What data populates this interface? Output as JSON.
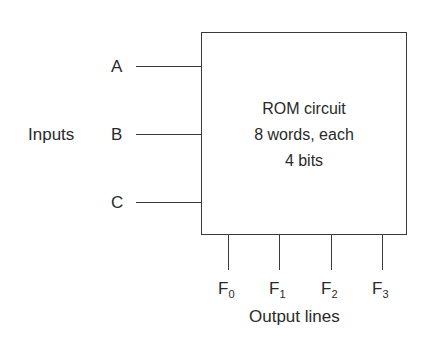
{
  "diagram": {
    "type": "block-diagram",
    "block": {
      "lines": [
        "ROM circuit",
        "8 words, each",
        "4 bits"
      ]
    },
    "inputs_group_label": "Inputs",
    "inputs": [
      {
        "label": "A"
      },
      {
        "label": "B"
      },
      {
        "label": "C"
      }
    ],
    "outputs": [
      {
        "base": "F",
        "sub": "0"
      },
      {
        "base": "F",
        "sub": "1"
      },
      {
        "base": "F",
        "sub": "2"
      },
      {
        "base": "F",
        "sub": "3"
      }
    ],
    "outputs_group_label": "Output lines"
  }
}
